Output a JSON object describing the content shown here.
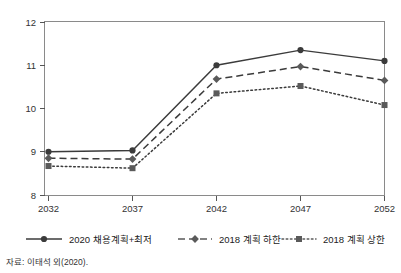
{
  "figure": {
    "source_note": "자료: 이태석 외(2020)."
  },
  "chart_data": {
    "type": "line",
    "title": "",
    "subtitle": "",
    "xlabel": "",
    "ylabel": "",
    "categories": [
      "2032",
      "2037",
      "2042",
      "2047",
      "2052"
    ],
    "x_tick_labels": [
      "2032",
      "2037",
      "2042",
      "2047",
      "2052"
    ],
    "y_tick_labels": [
      "8",
      "9",
      "10",
      "11",
      "12"
    ],
    "ylim": [
      8,
      12
    ],
    "xlim": [
      2032,
      2052
    ],
    "grid": false,
    "legend_position": "bottom",
    "series": [
      {
        "name": "2020 채용계획+최저",
        "values": [
          9.0,
          9.03,
          11.0,
          11.35,
          11.1
        ],
        "line_style": "solid",
        "marker": "circle",
        "color": "#3b3b3b"
      },
      {
        "name": "2018 계획 하한",
        "values": [
          8.85,
          8.83,
          10.68,
          10.97,
          10.65
        ],
        "line_style": "dashed",
        "marker": "diamond",
        "color": "#5a5a5a"
      },
      {
        "name": "2018 계획 상한",
        "values": [
          8.67,
          8.62,
          10.35,
          10.52,
          10.08
        ],
        "line_style": "dotted",
        "marker": "square",
        "color": "#5a5a5a"
      }
    ]
  },
  "legend": {
    "items": [
      {
        "label": "2020 채용계획+최저"
      },
      {
        "label": "2018 계획 하한"
      },
      {
        "label": "2018 계획 상한"
      }
    ]
  }
}
